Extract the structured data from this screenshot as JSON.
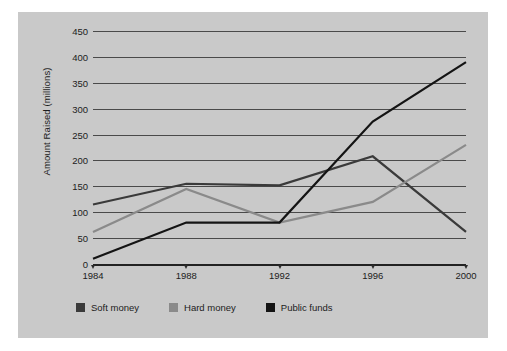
{
  "chart_data": {
    "type": "line",
    "title": "",
    "xlabel": "",
    "ylabel": "Amount Raised (millions)",
    "categories": [
      "1984",
      "1988",
      "1992",
      "1996",
      "2000"
    ],
    "ylim": [
      0,
      450
    ],
    "yticks": [
      0,
      50,
      100,
      150,
      200,
      250,
      300,
      350,
      400,
      450
    ],
    "grid": true,
    "legend_position": "bottom-left",
    "series": [
      {
        "name": "Soft money",
        "color": "#3a3a3a",
        "values": [
          115,
          155,
          152,
          208,
          62
        ]
      },
      {
        "name": "Hard money",
        "color": "#8a8a8a",
        "values": [
          62,
          145,
          80,
          120,
          230
        ]
      },
      {
        "name": "Public funds",
        "color": "#141414",
        "values": [
          10,
          80,
          80,
          275,
          390
        ]
      }
    ]
  },
  "colors": {
    "panel_background": "#c9c9c9",
    "page_background": "#ffffff",
    "gridline": "#4a4a4a",
    "axis": "#222222",
    "text": "#1c1c1c"
  }
}
